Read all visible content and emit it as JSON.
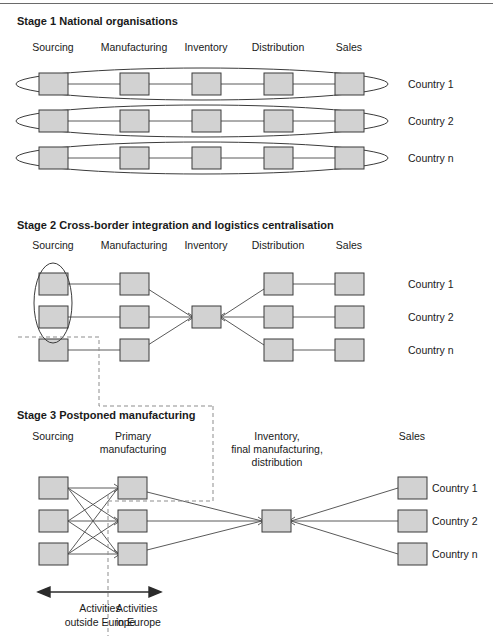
{
  "figure": {
    "kind": "three-stage supply chain evolution diagram",
    "top_rule": true
  },
  "stages": [
    {
      "id": "stage-1",
      "title": "Stage 1  National organisations",
      "title_number": "Stage 1",
      "title_text": "National organisations",
      "column_headers": [
        "Sourcing",
        "Manufacturing",
        "Inventory",
        "Distribution",
        "Sales"
      ],
      "rows": [
        "Country 1",
        "Country 2",
        "Country n"
      ],
      "grouping": "each country row enclosed in its own horizontal ellipse"
    },
    {
      "id": "stage-2",
      "title": "Stage 2  Cross-border integration and logistics centralisation",
      "title_number": "Stage 2",
      "title_text": "Cross-border integration and logistics centralisation",
      "column_headers": [
        "Sourcing",
        "Manufacturing",
        "Inventory",
        "Distribution",
        "Sales"
      ],
      "rows": [
        "Country 1",
        "Country 2",
        "Country n"
      ],
      "grouping": "vertical ellipse around sourcing of Country 1 and Country 2; single central inventory hub"
    },
    {
      "id": "stage-3",
      "title": "Stage 3  Postponed manufacturing",
      "title_number": "Stage 3",
      "title_text": "Postponed manufacturing",
      "column_headers": [
        "Sourcing",
        "Primary\nmanufacturing",
        "Inventory,\nfinal manufacturing,\ndistribution",
        "Sales"
      ],
      "column_headers_lines": [
        [
          "Sourcing"
        ],
        [
          "Primary",
          "manufacturing"
        ],
        [
          "Inventory,",
          "final manufacturing,",
          "distribution"
        ],
        [
          "Sales"
        ]
      ],
      "rows": [
        "Country 1",
        "Country 2",
        "Country n"
      ],
      "grouping": "fully connected sourcing to primary manufacturing; single central inventory hub"
    }
  ],
  "footer": {
    "left_label_lines": [
      "Activities",
      "outside Europe"
    ],
    "right_label_lines": [
      "Activities",
      "in Europe"
    ],
    "divider": "vertical dashed line",
    "arrow": "double-headed horizontal arrow"
  },
  "colors": {
    "node_fill": "#d2d2d2",
    "node_stroke": "#3b3b3b",
    "link": "#5a5a5a",
    "dashed": "#8d8d8d",
    "text": "#1a1a1a",
    "rule": "#6a6a6a"
  }
}
